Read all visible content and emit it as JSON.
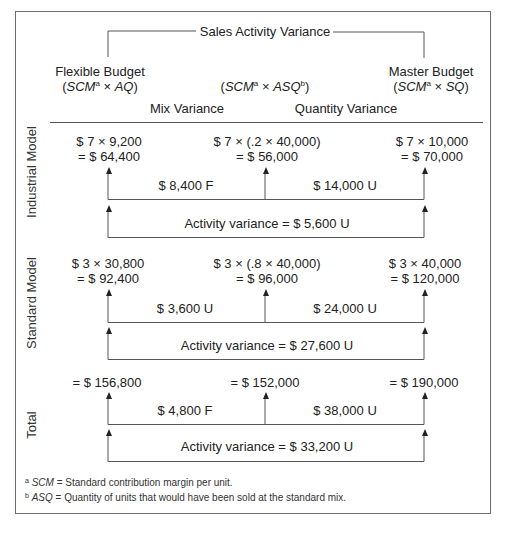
{
  "header": {
    "title": "Sales Activity Variance",
    "columns": [
      {
        "label": "Flexible Budget",
        "formula_parts": [
          "(",
          "SCM",
          "a",
          " × ",
          "AQ",
          ")"
        ]
      },
      {
        "label": "",
        "formula_parts": [
          "(",
          "SCM",
          "a",
          " × ",
          "ASQ",
          "b",
          ")"
        ]
      },
      {
        "label": "Master Budget",
        "formula_parts": [
          "(",
          "SCM",
          "a",
          " × ",
          "SQ",
          ")"
        ]
      }
    ],
    "variance_labels": {
      "mix": "Mix Variance",
      "quantity": "Quantity Variance"
    }
  },
  "sections": [
    {
      "name": "Industrial Model",
      "flexible": {
        "line1": "$ 7 × 9,200",
        "line2": "= $ 64,400"
      },
      "asq": {
        "line1": "$ 7 × (.2 × 40,000)",
        "line2": "= $ 56,000"
      },
      "master": {
        "line1": "$ 7 × 10,000",
        "line2": "= $ 70,000"
      },
      "mix_variance": "$ 8,400 F",
      "quantity_variance": "$ 14,000 U",
      "activity_variance": "Activity variance = $ 5,600 U"
    },
    {
      "name": "Standard Model",
      "flexible": {
        "line1": "$ 3 × 30,800",
        "line2": "= $ 92,400"
      },
      "asq": {
        "line1": "$ 3 × (.8 × 40,000)",
        "line2": "= $ 96,000"
      },
      "master": {
        "line1": "$ 3 × 40,000",
        "line2": "= $ 120,000"
      },
      "mix_variance": "$ 3,600 U",
      "quantity_variance": "$ 24,000 U",
      "activity_variance": "Activity variance = $ 27,600 U"
    },
    {
      "name": "Total",
      "flexible": {
        "line1": "= $ 156,800"
      },
      "asq": {
        "line1": "= $ 152,000"
      },
      "master": {
        "line1": "= $ 190,000"
      },
      "mix_variance": "$ 4,800 F",
      "quantity_variance": "$ 38,000 U",
      "activity_variance": "Activity variance = $ 33,200 U"
    }
  ],
  "footnotes": [
    {
      "mark": "a",
      "term": "SCM",
      "text": " = Standard contribution margin per unit."
    },
    {
      "mark": "b",
      "term": "ASQ",
      "text": " = Quantity of units that would have been sold at the standard mix."
    }
  ]
}
